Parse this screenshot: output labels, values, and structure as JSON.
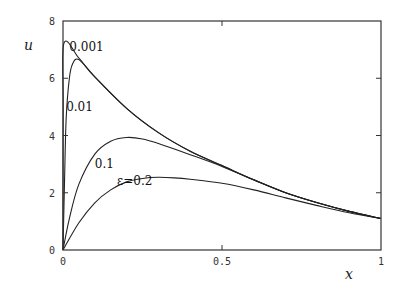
{
  "chart_data": {
    "type": "line",
    "title": "",
    "xlabel": "x",
    "ylabel": "u",
    "xlim": [
      0,
      1
    ],
    "ylim": [
      0,
      8
    ],
    "xticks": [
      "0",
      "0.5",
      "1"
    ],
    "yticks": [
      "0",
      "2",
      "4",
      "6",
      "8"
    ],
    "grid": false,
    "legend": "inline labels on curves",
    "series": [
      {
        "name": "0.001",
        "label": "0.001",
        "x": [
          0,
          0.0005,
          0.003,
          0.05,
          0.1,
          0.2,
          0.3,
          0.4,
          0.5,
          0.6,
          0.7,
          0.8,
          0.9,
          1.0
        ],
        "y": [
          0,
          5.0,
          7.23,
          6.7,
          6.05,
          4.95,
          4.1,
          3.45,
          2.95,
          2.45,
          2.0,
          1.65,
          1.35,
          1.1
        ]
      },
      {
        "name": "0.01",
        "label": "0.01",
        "x": [
          0,
          0.005,
          0.01,
          0.02,
          0.03,
          0.05,
          0.1,
          0.2,
          0.3,
          0.4,
          0.5,
          0.6,
          0.7,
          0.8,
          0.9,
          1.0
        ],
        "y": [
          0,
          2.5,
          4.6,
          6.0,
          6.5,
          6.65,
          6.05,
          4.95,
          4.1,
          3.45,
          2.95,
          2.45,
          2.0,
          1.65,
          1.35,
          1.1
        ]
      },
      {
        "name": "0.1",
        "label": "0.1",
        "x": [
          0,
          0.02,
          0.05,
          0.1,
          0.15,
          0.2,
          0.25,
          0.3,
          0.4,
          0.5,
          0.6,
          0.7,
          0.8,
          0.9,
          1.0
        ],
        "y": [
          0,
          1.1,
          2.3,
          3.35,
          3.8,
          3.93,
          3.88,
          3.72,
          3.33,
          2.92,
          2.45,
          2.0,
          1.65,
          1.35,
          1.1
        ]
      },
      {
        "name": "0.2",
        "label": "ε=0.2",
        "x": [
          0,
          0.05,
          0.1,
          0.15,
          0.2,
          0.25,
          0.3,
          0.35,
          0.4,
          0.5,
          0.6,
          0.7,
          0.8,
          0.9,
          1.0
        ],
        "y": [
          0,
          0.95,
          1.65,
          2.1,
          2.38,
          2.5,
          2.54,
          2.52,
          2.47,
          2.33,
          2.1,
          1.82,
          1.55,
          1.3,
          1.1
        ]
      }
    ],
    "annotations": [
      {
        "text": "0.001",
        "x": 0.02,
        "y": 7.1
      },
      {
        "text": "0.01",
        "x": 0.01,
        "y": 5.0
      },
      {
        "text": "0.1",
        "x": 0.1,
        "y": 3.0
      },
      {
        "text": "ε=0.2",
        "x": 0.17,
        "y": 2.4
      }
    ]
  }
}
